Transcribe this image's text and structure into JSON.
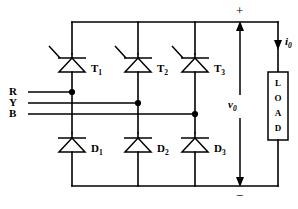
{
  "diagram": {
    "line_color": "#000000",
    "background_color": "#ffffff"
  },
  "phases": [
    {
      "label": "R",
      "leg": 1
    },
    {
      "label": "Y",
      "leg": 2
    },
    {
      "label": "B",
      "leg": 3
    }
  ],
  "thyristors": [
    {
      "name": "T",
      "sub": "1"
    },
    {
      "name": "T",
      "sub": "2"
    },
    {
      "name": "T",
      "sub": "3"
    }
  ],
  "diodes": [
    {
      "name": "D",
      "sub": "1"
    },
    {
      "name": "D",
      "sub": "2"
    },
    {
      "name": "D",
      "sub": "3"
    }
  ],
  "output": {
    "voltage_symbol": "v",
    "voltage_sub": "0",
    "current_symbol": "i",
    "current_sub": "0",
    "positive_sign": "+",
    "negative_sign": "−"
  },
  "load": {
    "letters": [
      "L",
      "O",
      "A",
      "D"
    ],
    "label": "LOAD"
  }
}
